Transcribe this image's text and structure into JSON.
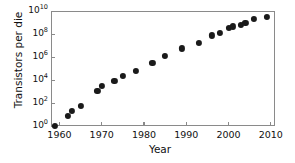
{
  "chart_data": {
    "type": "scatter",
    "title": "",
    "xlabel": "Year",
    "ylabel": "Transistors per die",
    "xlim": [
      1958,
      2011
    ],
    "ylim": [
      1,
      10000000000
    ],
    "yscale": "log",
    "xscale": "linear",
    "grid": false,
    "legend": null,
    "xticks": [
      1960,
      1970,
      1980,
      1990,
      2000,
      2010
    ],
    "xtick_labels": [
      "1960",
      "1970",
      "1980",
      "1990",
      "2000",
      "2010"
    ],
    "yticks": [
      1,
      100,
      10000,
      1000000,
      100000000,
      10000000000
    ],
    "ytick_labels": [
      "10⁰",
      "10²",
      "10⁴",
      "10⁶",
      "10⁸",
      "10¹⁰"
    ],
    "ytick_mantissa": [
      "10",
      "10",
      "10",
      "10",
      "10",
      "10"
    ],
    "ytick_exponent": [
      "0",
      "2",
      "4",
      "6",
      "8",
      "10"
    ],
    "marker": "circle",
    "marker_color": "#1a1a1a",
    "axis_color": "#8a8a8a",
    "background_color": "#ffffff",
    "points": [
      {
        "x": 1959,
        "y": 1
      },
      {
        "x": 1962,
        "y": 8
      },
      {
        "x": 1963,
        "y": 20
      },
      {
        "x": 1965,
        "y": 60
      },
      {
        "x": 1969,
        "y": 1100
      },
      {
        "x": 1970,
        "y": 3000
      },
      {
        "x": 1973,
        "y": 9000
      },
      {
        "x": 1975,
        "y": 24000
      },
      {
        "x": 1978,
        "y": 60000
      },
      {
        "x": 1982,
        "y": 300000
      },
      {
        "x": 1985,
        "y": 1300000
      },
      {
        "x": 1989,
        "y": 5500000
      },
      {
        "x": 1993,
        "y": 16000000
      },
      {
        "x": 1996,
        "y": 75000000
      },
      {
        "x": 1998,
        "y": 130000000
      },
      {
        "x": 2000,
        "y": 330000000
      },
      {
        "x": 2001,
        "y": 450000000
      },
      {
        "x": 2003,
        "y": 600000000
      },
      {
        "x": 2004,
        "y": 900000000
      },
      {
        "x": 2006,
        "y": 2000000000
      },
      {
        "x": 2009,
        "y": 3200000000
      }
    ]
  },
  "axes": {
    "ylabel_text": "Transistors per die",
    "xlabel_text": "Year"
  }
}
